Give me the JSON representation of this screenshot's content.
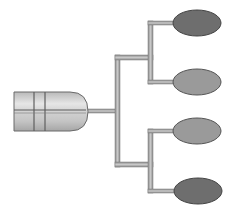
{
  "diagram": {
    "type": "tree",
    "root": {
      "shape": "cylinder",
      "x": 13,
      "y": 91,
      "width": 76,
      "height": 41,
      "fill": "#c8c8c8",
      "stroke": "#6a6a6a"
    },
    "connector_color": "#a8a8a8",
    "connector_stroke": "#6f6f6f",
    "leaves": [
      {
        "id": "leaf-1",
        "cx": 197,
        "cy": 23,
        "rx": 24,
        "ry": 13,
        "fill": "#6e6e6e"
      },
      {
        "id": "leaf-2",
        "cx": 197,
        "cy": 82,
        "rx": 24,
        "ry": 13,
        "fill": "#9a9a9a"
      },
      {
        "id": "leaf-3",
        "cx": 197,
        "cy": 131,
        "rx": 24,
        "ry": 13,
        "fill": "#9a9a9a"
      },
      {
        "id": "leaf-4",
        "cx": 198,
        "cy": 191,
        "rx": 24,
        "ry": 13,
        "fill": "#6e6e6e"
      }
    ]
  }
}
